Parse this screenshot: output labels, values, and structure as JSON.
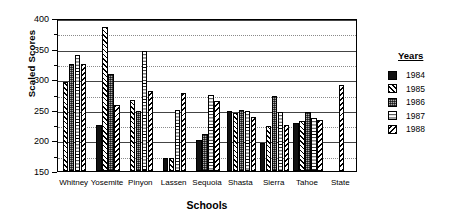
{
  "chart_data": {
    "type": "bar",
    "title": "",
    "xlabel": "Schools",
    "ylabel": "Scaled Scores",
    "ylim": [
      150,
      400
    ],
    "ytick_values": [
      150,
      200,
      250,
      300,
      350,
      400
    ],
    "ytick_labels": [
      "150",
      "200",
      "250",
      "300",
      "350",
      "400"
    ],
    "yminor_step": 25,
    "grid": true,
    "legend_position": "right",
    "legend_title": "Years",
    "categories": [
      "Whitney",
      "Yosemite",
      "Pinyon",
      "Lassen",
      "Sequoia",
      "Shasta",
      "Sierra",
      "Tahoe",
      "State"
    ],
    "series": [
      {
        "name": "1984",
        "key": "y1984",
        "swatch": "solid-black",
        "values": [
          null,
          225,
          null,
          171,
          200,
          248,
          196,
          228,
          null
        ]
      },
      {
        "name": "1985",
        "key": "y1985",
        "swatch": "diagonal-hatch",
        "values": [
          295,
          385,
          266,
          172,
          null,
          245,
          224,
          232,
          null
        ]
      },
      {
        "name": "1986",
        "key": "y1986",
        "swatch": "stipple-gray",
        "values": [
          325,
          308,
          248,
          null,
          210,
          250,
          272,
          247,
          null
        ]
      },
      {
        "name": "1987",
        "key": "y1987",
        "swatch": "white-horizontal",
        "values": [
          340,
          null,
          346,
          250,
          275,
          248,
          247,
          237,
          null
        ]
      },
      {
        "name": "1988",
        "key": "y1988",
        "swatch": "diagonal-hatch-alt",
        "values": [
          325,
          258,
          281,
          277,
          265,
          238,
          225,
          233,
          290
        ]
      }
    ]
  }
}
